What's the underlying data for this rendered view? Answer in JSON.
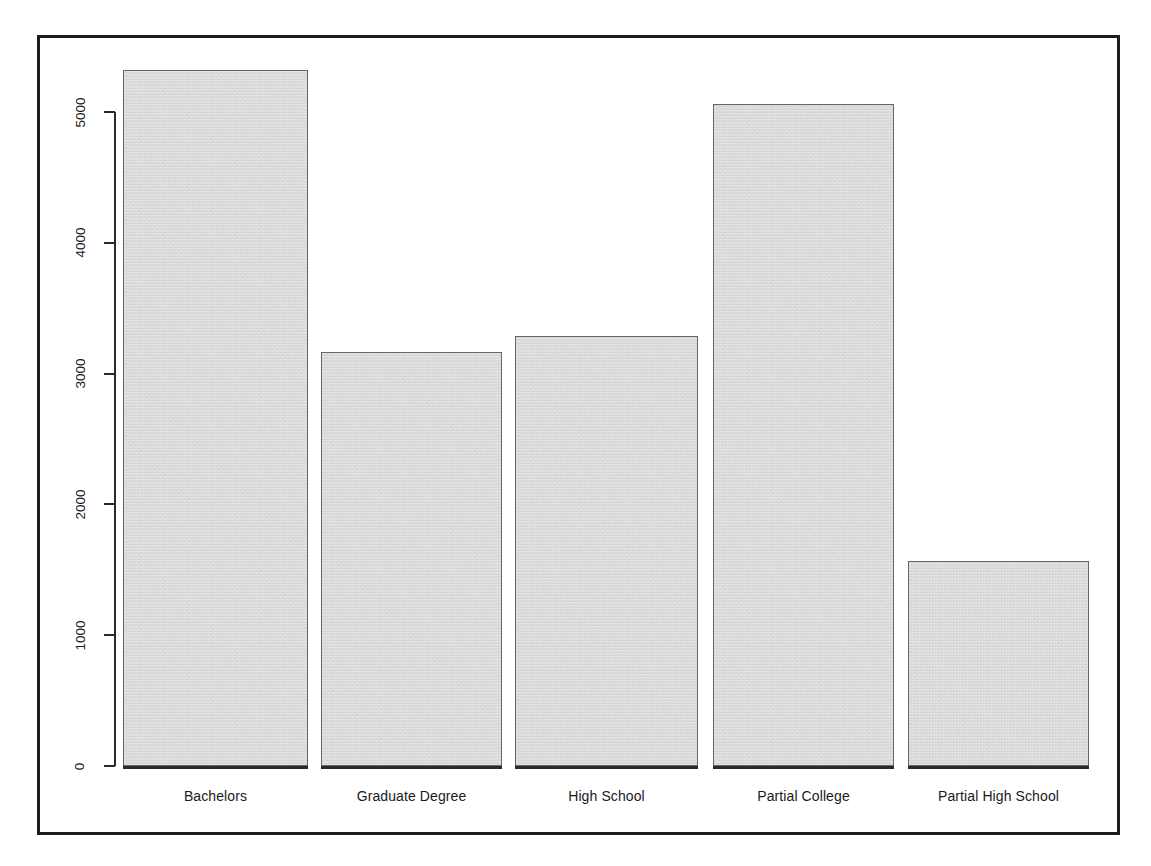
{
  "chart_data": {
    "type": "bar",
    "title": "",
    "subtitle": "",
    "xlabel": "",
    "ylabel": "",
    "categories": [
      "Bachelors",
      "Graduate Degree",
      "High School",
      "Partial College",
      "Partial High School"
    ],
    "values": [
      5320,
      3165,
      3290,
      5060,
      1570
    ],
    "yticks": [
      0,
      1000,
      2000,
      3000,
      4000,
      5000
    ],
    "ytick_labels": [
      "0",
      "1000",
      "2000",
      "3000",
      "4000",
      "5000"
    ],
    "ylim": [
      0,
      5450
    ],
    "grid": false,
    "legend": false,
    "legend_position": "none",
    "bar_fill_color": "#d5d5d5",
    "bar_border_color": "#666666",
    "axis_color": "#2a2a2a",
    "frame_color": "#1c1c1c",
    "background_color": "#ffffff",
    "ytick_label_rotation": -90,
    "series": [
      {
        "name": "count",
        "values": [
          5320,
          3165,
          3290,
          5060,
          1570
        ]
      }
    ],
    "bars": [
      {
        "label": "Bachelors",
        "value": 5320
      },
      {
        "label": "Graduate Degree",
        "value": 3165
      },
      {
        "label": "High School",
        "value": 3290
      },
      {
        "label": "Partial College",
        "value": 5060
      },
      {
        "label": "Partial High School",
        "value": 1570
      }
    ]
  }
}
